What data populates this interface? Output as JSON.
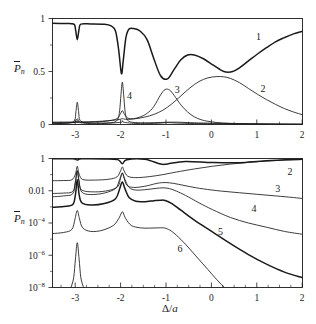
{
  "figure": {
    "ylabel": "P̄n",
    "ylabel_base": "P",
    "ylabel_sub": "n",
    "xlabel_top": "Δ/a",
    "xlabel": "Δ/a",
    "xlabel_delta": "Δ/",
    "xlabel_a": "a",
    "line_color": "#1a1a1a",
    "background": "#ffffff"
  },
  "chart_data": [
    {
      "type": "line",
      "panel": "top",
      "title": "",
      "xlabel": "Δ/a",
      "ylabel": "P̄n",
      "xlim": [
        -3.55,
        2.0
      ],
      "ylim": [
        0,
        1
      ],
      "yscale": "linear",
      "grid": false,
      "legend": "inline-curve-labels",
      "xticks": [
        -3,
        -2,
        -1,
        0,
        1,
        2
      ],
      "xticklabels": [
        "-3",
        "-2",
        "-1",
        "0",
        "1",
        "2"
      ],
      "yticks": [
        0,
        0.5,
        1
      ],
      "yticklabels": [
        "0",
        "0.5",
        "1"
      ],
      "annotations": [
        {
          "text": "1",
          "x": 1.02,
          "y": 0.8
        },
        {
          "text": "2",
          "x": 1.12,
          "y": 0.31
        },
        {
          "text": "3",
          "x": -0.78,
          "y": 0.295
        },
        {
          "text": "4",
          "x": -1.84,
          "y": 0.245
        }
      ],
      "series": [
        {
          "name": "1",
          "label": "1",
          "style": "bold",
          "comment": "Ground-state population: near 1 at large negative detuning, narrow dip at -3, deep resonance dip at -2, broad dip to 0.43 at -1.15, local max 0.66 at -0.55, min 0.49 at 0.3, rising to 0.88 at 2",
          "x": [
            -3.55,
            -3.3,
            -3.08,
            -3.04,
            -3.0,
            -2.96,
            -2.92,
            -2.7,
            -2.4,
            -2.25,
            -2.15,
            -2.08,
            -2.02,
            -1.98,
            -1.92,
            -1.85,
            -1.75,
            -1.6,
            -1.45,
            -1.3,
            -1.15,
            -1.0,
            -0.85,
            -0.7,
            -0.55,
            -0.4,
            -0.2,
            0.0,
            0.2,
            0.3,
            0.45,
            0.6,
            0.8,
            1.0,
            1.2,
            1.4,
            1.6,
            1.8,
            2.0
          ],
          "y": [
            0.955,
            0.952,
            0.948,
            0.9,
            0.8,
            0.9,
            0.947,
            0.948,
            0.945,
            0.93,
            0.88,
            0.7,
            0.48,
            0.6,
            0.82,
            0.9,
            0.905,
            0.88,
            0.8,
            0.62,
            0.46,
            0.43,
            0.52,
            0.61,
            0.655,
            0.655,
            0.62,
            0.565,
            0.51,
            0.495,
            0.5,
            0.535,
            0.6,
            0.665,
            0.725,
            0.78,
            0.82,
            0.855,
            0.88
          ]
        },
        {
          "name": "2",
          "label": "2",
          "style": "thin",
          "comment": "Broad hump peaking ~0.45 near Delta/a = 0.3, decaying to 0.09 at 2",
          "x": [
            -3.55,
            -3.0,
            -2.5,
            -2.1,
            -2.0,
            -1.9,
            -1.7,
            -1.5,
            -1.3,
            -1.1,
            -0.9,
            -0.7,
            -0.5,
            -0.3,
            -0.1,
            0.1,
            0.25,
            0.4,
            0.6,
            0.8,
            1.0,
            1.2,
            1.4,
            1.6,
            1.8,
            2.0
          ],
          "y": [
            0.022,
            0.024,
            0.03,
            0.045,
            0.055,
            0.048,
            0.055,
            0.07,
            0.095,
            0.135,
            0.195,
            0.27,
            0.345,
            0.405,
            0.44,
            0.452,
            0.45,
            0.435,
            0.395,
            0.34,
            0.285,
            0.235,
            0.19,
            0.15,
            0.118,
            0.092
          ]
        },
        {
          "name": "3",
          "label": "3",
          "style": "thin",
          "comment": "Resonance hump peaking ~0.33 at Delta/a = -1.05, small shoulder near -2",
          "x": [
            -3.55,
            -3.1,
            -3.04,
            -3.0,
            -2.96,
            -2.9,
            -2.6,
            -2.3,
            -2.12,
            -2.05,
            -2.0,
            -1.95,
            -1.88,
            -1.75,
            -1.6,
            -1.45,
            -1.3,
            -1.15,
            -1.05,
            -0.95,
            -0.85,
            -0.7,
            -0.55,
            -0.4,
            -0.25,
            -0.1,
            0.1,
            0.3,
            0.6,
            1.0,
            1.4,
            2.0
          ],
          "y": [
            0.018,
            0.019,
            0.03,
            0.055,
            0.03,
            0.02,
            0.023,
            0.035,
            0.055,
            0.095,
            0.13,
            0.095,
            0.06,
            0.055,
            0.072,
            0.105,
            0.17,
            0.28,
            0.33,
            0.325,
            0.275,
            0.185,
            0.118,
            0.072,
            0.045,
            0.03,
            0.019,
            0.013,
            0.008,
            0.005,
            0.003,
            0.002
          ]
        },
        {
          "name": "4",
          "label": "4",
          "style": "thin",
          "comment": "Sharp narrow resonance spike reaching ~0.40 exactly at Delta/a = -2, plus narrow spike at -3",
          "x": [
            -3.55,
            -3.2,
            -3.06,
            -3.03,
            -3.0,
            -2.97,
            -2.94,
            -2.8,
            -2.5,
            -2.2,
            -2.1,
            -2.06,
            -2.03,
            -2.0,
            -1.97,
            -1.94,
            -1.9,
            -1.82,
            -1.7,
            -1.5,
            -1.3,
            -1.1,
            -0.9,
            -0.7,
            -0.4,
            0.0,
            0.5,
            1.0,
            1.5,
            2.0
          ],
          "y": [
            0.012,
            0.013,
            0.04,
            0.12,
            0.21,
            0.12,
            0.04,
            0.015,
            0.014,
            0.02,
            0.05,
            0.13,
            0.28,
            0.4,
            0.28,
            0.13,
            0.05,
            0.025,
            0.018,
            0.016,
            0.017,
            0.02,
            0.022,
            0.021,
            0.016,
            0.012,
            0.008,
            0.006,
            0.004,
            0.003
          ]
        },
        {
          "name": "5",
          "label": "",
          "style": "thin",
          "comment": "Low-lying near-zero trace along the baseline with small bumps at resonances",
          "x": [
            -3.55,
            -3.02,
            -3.0,
            -2.98,
            -2.6,
            -2.05,
            -2.0,
            -1.95,
            -1.6,
            -1.2,
            -1.0,
            -0.8,
            -0.4,
            0.0,
            0.5,
            1.0,
            1.5,
            2.0
          ],
          "y": [
            0.006,
            0.02,
            0.035,
            0.02,
            0.007,
            0.02,
            0.035,
            0.02,
            0.008,
            0.012,
            0.018,
            0.014,
            0.009,
            0.007,
            0.005,
            0.004,
            0.003,
            0.002
          ]
        }
      ]
    },
    {
      "type": "line",
      "panel": "bottom",
      "title": "",
      "xlabel": "Δ/a",
      "ylabel": "P̄n",
      "xlim": [
        -3.55,
        2.0
      ],
      "ylim": [
        1e-08,
        1
      ],
      "yscale": "log",
      "grid": false,
      "legend": "inline-curve-labels",
      "xticks": [
        -3,
        -2,
        -1,
        0,
        1,
        2
      ],
      "xticklabels": [
        "-3",
        "-2",
        "-1",
        "0",
        "1",
        "2"
      ],
      "yticks": [
        1,
        0.01,
        0.0001,
        1e-06,
        1e-08
      ],
      "yticklabels": [
        "1",
        "0.01",
        "10^-4",
        "10^-6",
        "10^-8"
      ],
      "annotations": [
        {
          "text": "2",
          "x": 1.72,
          "y": 0.09
        },
        {
          "text": "3",
          "x": 1.45,
          "y": 0.009
        },
        {
          "text": "4",
          "x": 0.92,
          "y": 0.0005
        },
        {
          "text": "5",
          "x": 0.18,
          "y": 1.8e-05
        },
        {
          "text": "6",
          "x": -0.72,
          "y": 1.6e-06
        }
      ],
      "series": [
        {
          "name": "1",
          "label": "",
          "style": "bold",
          "comment": "Top curve pinned near 1 across the whole range with slight dips at the -3, -2 and -1 resonances",
          "x": [
            -3.55,
            -3.1,
            -3.0,
            -2.9,
            -2.4,
            -2.1,
            -2.0,
            -1.9,
            -1.5,
            -1.15,
            -1.0,
            -0.6,
            0.0,
            0.6,
            1.2,
            2.0
          ],
          "y": [
            0.955,
            0.95,
            0.8,
            0.95,
            0.945,
            0.85,
            0.48,
            0.85,
            0.9,
            0.45,
            0.46,
            0.66,
            0.56,
            0.55,
            0.73,
            0.89
          ]
        },
        {
          "name": "2",
          "label": "2",
          "style": "thin",
          "comment": "Starts ~4e-2 at left, sharp peak at -3 and -2, rises monotonically toward 1 near Delta/a = 2",
          "x": [
            -3.55,
            -3.3,
            -3.12,
            -3.04,
            -3.0,
            -2.96,
            -2.88,
            -2.6,
            -2.3,
            -2.12,
            -2.04,
            -2.0,
            -1.96,
            -1.88,
            -1.7,
            -1.4,
            -1.1,
            -0.8,
            -0.4,
            0.0,
            0.4,
            0.8,
            1.2,
            1.6,
            2.0
          ],
          "y": [
            0.042,
            0.043,
            0.048,
            0.11,
            0.33,
            0.11,
            0.05,
            0.046,
            0.052,
            0.072,
            0.17,
            0.3,
            0.17,
            0.08,
            0.065,
            0.075,
            0.1,
            0.145,
            0.225,
            0.33,
            0.45,
            0.58,
            0.7,
            0.8,
            0.88
          ]
        },
        {
          "name": "3",
          "label": "3",
          "style": "thin",
          "comment": "Starts ~7e-3, resonance spikes at -3 and -2, broad hump near -1, then steady decay to ~3e-3",
          "x": [
            -3.55,
            -3.3,
            -3.1,
            -3.04,
            -3.0,
            -2.96,
            -2.9,
            -2.6,
            -2.3,
            -2.1,
            -2.04,
            -2.0,
            -1.96,
            -1.9,
            -1.75,
            -1.5,
            -1.25,
            -1.1,
            -0.95,
            -0.75,
            -0.5,
            -0.2,
            0.2,
            0.6,
            1.0,
            1.4,
            1.8,
            2.0
          ],
          "y": [
            0.0068,
            0.0072,
            0.009,
            0.04,
            0.18,
            0.04,
            0.011,
            0.0085,
            0.0105,
            0.018,
            0.06,
            0.13,
            0.06,
            0.022,
            0.016,
            0.019,
            0.028,
            0.032,
            0.031,
            0.025,
            0.018,
            0.013,
            0.0095,
            0.0075,
            0.006,
            0.0048,
            0.0038,
            0.0033
          ]
        },
        {
          "name": "4",
          "label": "4",
          "style": "thin",
          "comment": "Starts ~4e-3, peaks at resonances, hump near -1.1 at ~1.5e-2, decays to ~2e-5 at right",
          "x": [
            -3.55,
            -3.3,
            -3.1,
            -3.04,
            -3.0,
            -2.96,
            -2.9,
            -2.7,
            -2.4,
            -2.15,
            -2.06,
            -2.0,
            -1.94,
            -1.85,
            -1.7,
            -1.45,
            -1.25,
            -1.1,
            -0.95,
            -0.8,
            -0.6,
            -0.3,
            0.0,
            0.4,
            0.8,
            1.2,
            1.6,
            2.0
          ],
          "y": [
            0.0042,
            0.0048,
            0.0065,
            0.035,
            0.16,
            0.035,
            0.0082,
            0.0058,
            0.0072,
            0.014,
            0.05,
            0.12,
            0.05,
            0.016,
            0.011,
            0.012,
            0.014,
            0.0152,
            0.0135,
            0.0095,
            0.0052,
            0.0018,
            0.00068,
            0.00022,
            0.0001,
            5.5e-05,
            3e-05,
            2e-05
          ]
        },
        {
          "name": "5",
          "label": "5",
          "style": "bold",
          "comment": "Bold curve from ~1e-3 with resonance peaks, shoulder near -1, steep decay to ~1e-7 at right",
          "x": [
            -3.55,
            -3.3,
            -3.1,
            -3.04,
            -3.0,
            -2.96,
            -2.9,
            -2.7,
            -2.4,
            -2.15,
            -2.06,
            -2.0,
            -1.94,
            -1.85,
            -1.7,
            -1.5,
            -1.3,
            -1.15,
            -1.05,
            -0.9,
            -0.7,
            -0.4,
            0.0,
            0.4,
            0.8,
            1.2,
            1.6,
            2.0
          ],
          "y": [
            0.00095,
            0.00105,
            0.0014,
            0.006,
            0.05,
            0.006,
            0.0018,
            0.0013,
            0.0016,
            0.0032,
            0.013,
            0.035,
            0.013,
            0.0038,
            0.0022,
            0.0021,
            0.0024,
            0.0026,
            0.0025,
            0.0016,
            0.00062,
            0.00015,
            2.8e-05,
            5.2e-06,
            1.1e-06,
            2.8e-07,
            9e-08,
            4e-08
          ]
        },
        {
          "name": "6",
          "label": "6",
          "style": "thin",
          "comment": "Starts ~2e-5, sharp peak at -3 ~5e-4, peak at -2 ~3e-4, plateau then steep drop below 1e-8 near 0.5",
          "x": [
            -3.55,
            -3.3,
            -3.12,
            -3.05,
            -3.0,
            -2.95,
            -2.88,
            -2.7,
            -2.45,
            -2.2,
            -2.08,
            -2.02,
            -2.0,
            -1.98,
            -1.92,
            -1.8,
            -1.6,
            -1.4,
            -1.2,
            -1.05,
            -0.9,
            -0.7,
            -0.5,
            -0.3,
            -0.1,
            0.1,
            0.3,
            0.45
          ],
          "y": [
            2.2e-05,
            2.6e-05,
            4e-05,
            0.00018,
            0.0006,
            0.00018,
            5e-05,
            3e-05,
            3.5e-05,
            7e-05,
            0.00019,
            0.00042,
            0.0005,
            0.00042,
            0.00018,
            7e-05,
            5e-05,
            4.8e-05,
            5e-05,
            4.8e-05,
            3e-05,
            9.5e-06,
            2.4e-06,
            5.5e-07,
            1.3e-07,
            3e-08,
            8e-09,
            3e-09
          ]
        },
        {
          "name": "7",
          "label": "",
          "style": "thin",
          "comment": "Lowest trace: only the narrow -3 resonance spike rises above the 1e-8 floor",
          "x": [
            -3.14,
            -3.08,
            -3.04,
            -3.0,
            -2.96,
            -2.92,
            -2.86
          ],
          "y": [
            1e-08,
            4e-08,
            6e-07,
            6e-06,
            6e-07,
            4e-08,
            1e-08
          ]
        }
      ]
    }
  ]
}
